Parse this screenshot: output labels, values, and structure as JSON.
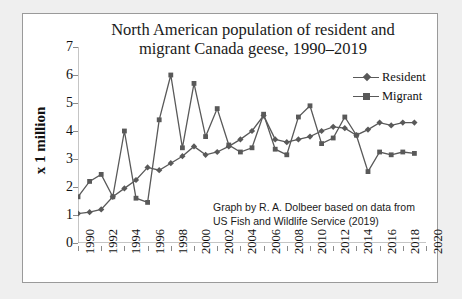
{
  "chart_data": {
    "type": "line",
    "title": "North American population of resident and migrant Canada geese, 1990–2019",
    "title_line1": "North American population of resident and",
    "title_line2": "migrant Canada geese, 1990–2019",
    "xlabel": "",
    "ylabel": "x 1 million",
    "ylim": [
      0,
      7
    ],
    "xlim": [
      1990,
      2020
    ],
    "yticks": [
      0,
      1,
      2,
      3,
      4,
      5,
      6,
      7
    ],
    "xticks": [
      1990,
      1992,
      1994,
      1996,
      1998,
      2000,
      2002,
      2004,
      2006,
      2008,
      2010,
      2012,
      2014,
      2016,
      2018,
      2020
    ],
    "grid": false,
    "legend_position": "top-right",
    "x": [
      1990,
      1991,
      1992,
      1993,
      1994,
      1995,
      1996,
      1997,
      1998,
      1999,
      2000,
      2001,
      2002,
      2003,
      2004,
      2005,
      2006,
      2007,
      2008,
      2009,
      2010,
      2011,
      2012,
      2013,
      2014,
      2015,
      2016,
      2017,
      2018,
      2019
    ],
    "series": [
      {
        "name": "Resident",
        "marker": "diamond",
        "color": "#595959",
        "values": [
          1.05,
          1.1,
          1.2,
          1.65,
          1.95,
          2.25,
          2.7,
          2.6,
          2.85,
          3.1,
          3.45,
          3.15,
          3.25,
          3.45,
          3.7,
          4.0,
          4.55,
          3.7,
          3.6,
          3.7,
          3.8,
          4.0,
          4.15,
          4.1,
          3.85,
          4.05,
          4.3,
          4.2,
          4.3,
          4.3
        ]
      },
      {
        "name": "Migrant",
        "marker": "square",
        "color": "#595959",
        "values": [
          1.65,
          2.2,
          2.45,
          1.65,
          4.0,
          1.6,
          1.45,
          4.4,
          6.0,
          3.4,
          5.7,
          3.8,
          4.8,
          3.5,
          3.25,
          3.4,
          4.6,
          3.35,
          3.15,
          4.5,
          4.9,
          3.55,
          3.75,
          4.5,
          3.85,
          2.55,
          3.25,
          3.15,
          3.25,
          3.2
        ]
      }
    ],
    "annotation_line1": "Graph by R. A. Dolbeer based on data from",
    "annotation_line2": "US Fish and Wildlife Service (2019)"
  },
  "legend": {
    "items": [
      {
        "label": "Resident"
      },
      {
        "label": "Migrant"
      }
    ]
  },
  "colors": {
    "line": "#595959",
    "axis": "#8b8b8b",
    "text": "#111111",
    "frame_border": "#9a9a9a",
    "page_background": "#efefef",
    "plot_background": "#ffffff"
  }
}
